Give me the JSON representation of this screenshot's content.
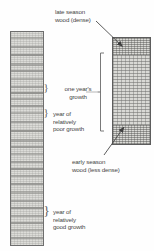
{
  "diagram": {
    "type": "annotated-illustration"
  },
  "labels": {
    "late_season": "late season\nwood (dense)",
    "one_years_growth": "one year's\ngrowth",
    "poor_growth": "year of\nrelatively\npoor growth",
    "early_season": "early season\nwood (less dense)",
    "good_growth": "year of\nrelatively\ngood growth"
  },
  "braces": {
    "one_year": "}",
    "poor_year": "}",
    "good_year": "}"
  },
  "colors": {
    "background": "#ffffff",
    "text": "#474747",
    "core_fill": "#dcdcd8",
    "core_border": "#6e6e6e",
    "ring_dark": "#8f8f8c",
    "block_fill": "#d9d9d5",
    "block_border": "#5d5d5d",
    "dense_band": "#a6a6a2",
    "leader_line": "#4a4a4a"
  },
  "core_sample": {
    "name": "core-sample-strip",
    "ring_count": 27,
    "ring_positions_pct": [
      2.5,
      6.5,
      10.5,
      14.5,
      18.0,
      22.0,
      25.5,
      28.5,
      31.5,
      34.5,
      38.0,
      42.0,
      46.5,
      50.5,
      54.0,
      57.5,
      61.0,
      64.5,
      68.0,
      71.5,
      75.5,
      79.5,
      83.0,
      86.5,
      90.0,
      93.5,
      97.0
    ],
    "ring_thickness_px": [
      2,
      2,
      2,
      3,
      2,
      2,
      2,
      2,
      2,
      2,
      2,
      2,
      2,
      3,
      2,
      2,
      2,
      2,
      2,
      2,
      3,
      2,
      2,
      2,
      2,
      2,
      2
    ]
  },
  "magnified_block": {
    "name": "magnified-wood-block",
    "bands": [
      {
        "kind": "dense",
        "label_ref": "late_season",
        "top_pct": 0,
        "height_pct": 16
      },
      {
        "kind": "light",
        "label_ref": "early_season",
        "top_pct": 16,
        "height_pct": 66
      },
      {
        "kind": "dense",
        "label_ref": "early_season",
        "top_pct": 82,
        "height_pct": 18
      }
    ]
  },
  "annotations": {
    "late_season_arrow": "leader-arrow-to-dense-band",
    "early_season_arrow": "leader-arrow-to-light-band",
    "growth_bracket": "one-year-growth-bracket"
  }
}
